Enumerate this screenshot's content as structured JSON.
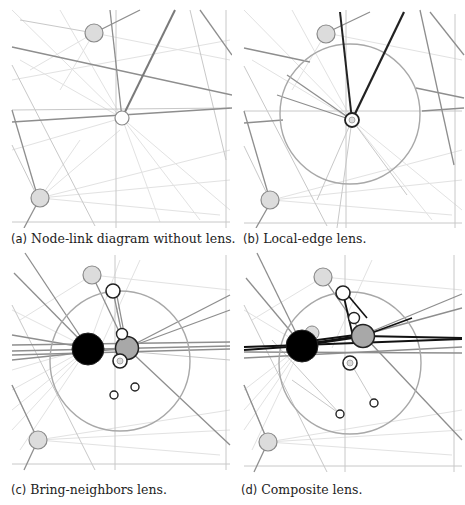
{
  "figure": {
    "panels": [
      {
        "id": "a",
        "label": "(a)",
        "caption": "Node-link diagram without lens.",
        "lens": "none"
      },
      {
        "id": "b",
        "label": "(b)",
        "caption": "Local-edge lens.",
        "lens": "local-edge"
      },
      {
        "id": "c",
        "label": "(c)",
        "caption": "Bring-neighbors lens.",
        "lens": "bring-neighbors"
      },
      {
        "id": "d",
        "label": "(d)",
        "caption": "Composite lens.",
        "lens": "composite"
      }
    ],
    "colors": {
      "background": "#ffffff",
      "edge_light": "#d8d8d8",
      "edge_medium": "#9a9a9a",
      "edge_dark": "#555555",
      "edge_highlight": "#111111",
      "node_gray_fill": "#dcdcdc",
      "node_gray_stroke": "#8a8a8a",
      "node_focus_fill": "#000000",
      "node_neighbor_fill": "#a8a8a8",
      "node_white_fill": "#ffffff",
      "lens_ring": "#a0a0a0"
    }
  }
}
